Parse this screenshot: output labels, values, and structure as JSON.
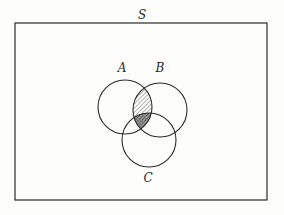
{
  "diagram": {
    "type": "venn",
    "universe_label": "S",
    "sets": [
      {
        "id": "A",
        "label": "A",
        "cx": 125,
        "cy": 107,
        "r": 27,
        "label_x": 122,
        "label_y": 68
      },
      {
        "id": "B",
        "label": "B",
        "cx": 160,
        "cy": 110,
        "r": 27,
        "label_x": 160,
        "label_y": 68
      },
      {
        "id": "C",
        "label": "C",
        "cx": 149,
        "cy": 140,
        "r": 27,
        "label_x": 148,
        "label_y": 178
      }
    ],
    "universe_rect": {
      "x": 15,
      "y": 23,
      "width": 252,
      "height": 177
    },
    "universe_label_pos": {
      "x": 142,
      "y": 15
    },
    "shaded_regions": [
      {
        "region": "A∩B",
        "style": "hatched"
      },
      {
        "region": "A∩B∩C",
        "style": "cross-hatched"
      }
    ],
    "colors": {
      "stroke": "#2a2a2a",
      "background": "#fdfdfb",
      "hatch": "#555555"
    }
  }
}
